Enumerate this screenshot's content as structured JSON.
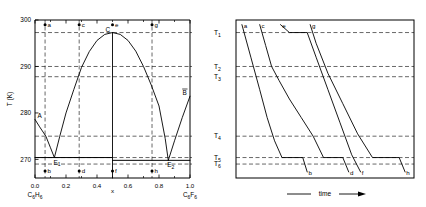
{
  "figure": {
    "left_panel": {
      "ylabel": "T (K)",
      "xlabel": "x",
      "ytick_labels": [
        "300",
        "290",
        "280",
        "270"
      ],
      "ytick_values": [
        300,
        290,
        280,
        270
      ],
      "xtick_labels": [
        "0.0",
        "0.2",
        "0.4",
        "0.6",
        "0.8",
        "1.0"
      ],
      "xtick_values": [
        0.0,
        0.2,
        0.4,
        0.6,
        0.8,
        1.0
      ],
      "x_left_component": "C6H6",
      "x_right_component": "C6F6",
      "point_labels": [
        "a",
        "b",
        "c",
        "d",
        "e",
        "f",
        "g",
        "h"
      ],
      "feature_labels": [
        "A",
        "B",
        "C",
        "E1",
        "E2"
      ],
      "eutectic_1_label": "E1",
      "eutectic_2_label": "E2",
      "congruent_label": "C",
      "pure_a_label": "A",
      "pure_b_label": "B"
    },
    "right_panel": {
      "xlabel": "time",
      "temperature_labels": [
        "T1",
        "T2",
        "T3",
        "T4",
        "T5",
        "T6"
      ],
      "curve_labels_top": [
        "a",
        "c",
        "e",
        "g"
      ],
      "curve_labels_bottom": [
        "b",
        "d",
        "f",
        "h"
      ]
    }
  },
  "chart_data": {
    "type": "line",
    "title": "",
    "xlabel": "x",
    "ylabel": "T (K)",
    "xlim": [
      0.0,
      1.0
    ],
    "ylim": [
      266,
      300
    ],
    "grid": false,
    "legend": "none",
    "panels": [
      {
        "name": "binary-phase-diagram",
        "type": "line",
        "xlabel": "x",
        "ylabel": "T (K)",
        "xlim": [
          0.0,
          1.0
        ],
        "ylim": [
          266,
          300
        ],
        "xticks": [
          0.0,
          0.2,
          0.4,
          0.6,
          0.8,
          1.0
        ],
        "yticks": [
          270,
          280,
          290,
          300
        ],
        "series": [
          {
            "name": "liquidus-left-branch",
            "comment": "from pure C6H6 melting point A down to eutectic E1",
            "x": [
              0.0,
              0.03,
              0.07,
              0.1,
              0.125
            ],
            "y": [
              278.6,
              277.0,
              275.0,
              272.5,
              270.4
            ]
          },
          {
            "name": "liquidus-compound-left",
            "comment": "from eutectic E1 up to congruent maximum C",
            "x": [
              0.125,
              0.16,
              0.2,
              0.25,
              0.3,
              0.35,
              0.4,
              0.45,
              0.5
            ],
            "y": [
              270.4,
              275.0,
              280.0,
              285.0,
              289.8,
              293.2,
              295.6,
              296.9,
              297.3
            ]
          },
          {
            "name": "liquidus-compound-right",
            "comment": "from congruent maximum C down to eutectic E2",
            "x": [
              0.5,
              0.55,
              0.6,
              0.65,
              0.7,
              0.75,
              0.8,
              0.84,
              0.86
            ],
            "y": [
              297.3,
              296.9,
              295.6,
              293.3,
              290.0,
              286.0,
              281.5,
              274.5,
              269.8
            ]
          },
          {
            "name": "liquidus-right-branch",
            "comment": "from eutectic E2 up to pure C6F6 melting point B",
            "x": [
              0.86,
              0.9,
              0.95,
              1.0
            ],
            "y": [
              269.8,
              274.0,
              279.0,
              283.6
            ]
          },
          {
            "name": "eutectic-line-E1",
            "comment": "horizontal eutectic tie line at T6 on the left",
            "x": [
              0.0,
              0.5
            ],
            "y": [
              270.4,
              270.4
            ]
          },
          {
            "name": "eutectic-line-E2",
            "comment": "horizontal eutectic tie line at T6-prime on the right",
            "x": [
              0.5,
              1.0
            ],
            "y": [
              269.8,
              269.8
            ]
          },
          {
            "name": "compound-vertical-line",
            "comment": "stoichiometric 1:1 compound composition",
            "x": [
              0.5,
              0.5
            ],
            "y": [
              266.0,
              297.3
            ]
          }
        ],
        "dashed_horizontals": [
          {
            "name": "T1",
            "y": 297.3
          },
          {
            "name": "T2",
            "y": 290.0
          },
          {
            "name": "T3",
            "y": 287.8
          },
          {
            "name": "T4",
            "y": 275.0
          },
          {
            "name": "T5",
            "y": 270.4
          },
          {
            "name": "T6",
            "y": 269.0
          }
        ],
        "dashed_verticals": [
          {
            "name": "a-b",
            "x": 0.065
          },
          {
            "name": "c-d",
            "x": 0.285
          },
          {
            "name": "g-h",
            "x": 0.755
          }
        ],
        "annotated_points": [
          {
            "label": "a",
            "x": 0.065,
            "y": 299.0
          },
          {
            "label": "b",
            "x": 0.065,
            "y": 267.5
          },
          {
            "label": "c",
            "x": 0.285,
            "y": 299.0
          },
          {
            "label": "d",
            "x": 0.285,
            "y": 267.5
          },
          {
            "label": "e",
            "x": 0.5,
            "y": 299.0
          },
          {
            "label": "f",
            "x": 0.5,
            "y": 267.5
          },
          {
            "label": "g",
            "x": 0.755,
            "y": 299.0
          },
          {
            "label": "h",
            "x": 0.755,
            "y": 267.5
          },
          {
            "label": "A",
            "x": 0.0,
            "y": 278.6
          },
          {
            "label": "B",
            "x": 1.0,
            "y": 283.6
          },
          {
            "label": "C",
            "x": 0.5,
            "y": 297.3
          },
          {
            "label": "E1",
            "x": 0.125,
            "y": 270.4
          },
          {
            "label": "E2",
            "x": 0.86,
            "y": 269.8
          }
        ]
      },
      {
        "name": "cooling-curves",
        "type": "line",
        "xlabel": "time",
        "ylabel": "",
        "xlim": [
          0,
          100
        ],
        "ylim": [
          266,
          300
        ],
        "temperature_gridlines": [
          {
            "name": "T1",
            "y": 297.3
          },
          {
            "name": "T2",
            "y": 290.0
          },
          {
            "name": "T3",
            "y": 287.8
          },
          {
            "name": "T4",
            "y": 275.0
          },
          {
            "name": "T5",
            "y": 270.4
          },
          {
            "name": "T6",
            "y": 269.0
          }
        ],
        "series": [
          {
            "name": "cooling-curve-a-b",
            "start_label": "a",
            "end_label": "b",
            "x": [
              4,
              10,
              16,
              21,
              26,
              31,
              45,
              48
            ],
            "y": [
              299.0,
              292.0,
              285.0,
              279.0,
              274.0,
              270.4,
              270.4,
              267.3
            ]
          },
          {
            "name": "cooling-curve-c-d",
            "start_label": "c",
            "end_label": "d",
            "x": [
              16,
              20,
              24,
              29,
              36,
              44,
              52,
              59,
              72,
              76
            ],
            "y": [
              299.0,
              294.5,
              290.0,
              287.0,
              283.0,
              279.0,
              275.0,
              270.4,
              270.4,
              267.3
            ]
          },
          {
            "name": "cooling-curve-e-f",
            "start_label": "e",
            "end_label": "f",
            "x": [
              30,
              36,
              48,
              54,
              62,
              70,
              78,
              84
            ],
            "y": [
              299.0,
              297.3,
              297.3,
              292.0,
              285.0,
              278.0,
              271.0,
              267.3
            ]
          },
          {
            "name": "cooling-curve-g-h",
            "start_label": "g",
            "end_label": "h",
            "x": [
              50,
              54,
              62,
              72,
              82,
              92,
              110,
              114
            ],
            "y": [
              299.0,
              295.0,
              288.5,
              282.0,
              275.5,
              270.4,
              270.4,
              267.3
            ]
          }
        ]
      }
    ]
  }
}
